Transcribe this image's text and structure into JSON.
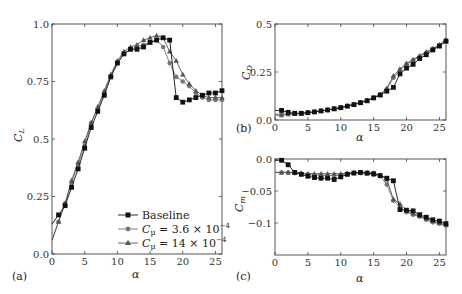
{
  "chart_data": [
    {
      "panel": "(a)",
      "type": "line",
      "xlabel": "α",
      "ylabel": "C_L",
      "xlim": [
        0,
        26
      ],
      "ylim": [
        0,
        1.0
      ],
      "xticks": [
        0,
        5,
        10,
        15,
        20,
        25
      ],
      "yticks": [
        0.0,
        0.25,
        0.5,
        0.75,
        1.0
      ],
      "ytick_labels": [
        "0.0",
        "0.25",
        "0.5",
        "0.75",
        "1.0"
      ],
      "legend_position": "lower right",
      "x": [
        1,
        2,
        3,
        4,
        5,
        6,
        7,
        8,
        9,
        10,
        11,
        12,
        13,
        14,
        15,
        16,
        17,
        18,
        19,
        20,
        21,
        22,
        23,
        24,
        25,
        26
      ],
      "series": [
        {
          "name": "Baseline",
          "marker": "square",
          "color": "#111111",
          "values": [
            0.17,
            0.21,
            0.29,
            0.37,
            0.46,
            0.55,
            0.62,
            0.69,
            0.77,
            0.83,
            0.87,
            0.89,
            0.89,
            0.9,
            0.92,
            0.93,
            0.94,
            0.93,
            0.68,
            0.66,
            0.67,
            0.68,
            0.69,
            0.7,
            0.7,
            0.71
          ]
        },
        {
          "name": "Cμ = 3.6 × 10⁻⁴",
          "marker": "circle",
          "color": "#777777",
          "values": [
            0.14,
            0.22,
            0.31,
            0.39,
            0.47,
            0.57,
            0.63,
            0.7,
            0.77,
            0.83,
            0.87,
            0.89,
            0.9,
            0.91,
            0.92,
            0.93,
            0.9,
            0.83,
            0.77,
            0.75,
            0.73,
            0.7,
            0.68,
            0.67,
            0.67,
            0.67
          ]
        },
        {
          "name": "Cμ = 14 × 10⁻⁴",
          "marker": "triangle",
          "color": "#555555",
          "values": [
            0.14,
            0.22,
            0.32,
            0.4,
            0.49,
            0.57,
            0.64,
            0.71,
            0.78,
            0.84,
            0.88,
            0.9,
            0.91,
            0.93,
            0.94,
            0.95,
            0.94,
            0.88,
            0.84,
            0.78,
            0.74,
            0.71,
            0.69,
            0.68,
            0.68,
            0.68
          ]
        }
      ]
    },
    {
      "panel": "(b)",
      "type": "line",
      "xlabel": "α",
      "ylabel": "C_D",
      "xlim": [
        0,
        26
      ],
      "ylim": [
        0,
        0.5
      ],
      "xticks": [
        0,
        5,
        10,
        15,
        20,
        25
      ],
      "yticks": [
        0.0,
        0.25,
        0.5
      ],
      "ytick_labels": [
        "0.0",
        "0.25",
        "0.5"
      ],
      "x": [
        1,
        2,
        3,
        4,
        5,
        6,
        7,
        8,
        9,
        10,
        11,
        12,
        13,
        14,
        15,
        16,
        17,
        18,
        19,
        20,
        21,
        22,
        23,
        24,
        25,
        26
      ],
      "series": [
        {
          "name": "Baseline",
          "marker": "square",
          "color": "#111111",
          "values": [
            0.05,
            0.04,
            0.035,
            0.035,
            0.038,
            0.042,
            0.047,
            0.052,
            0.058,
            0.064,
            0.072,
            0.08,
            0.09,
            0.1,
            0.115,
            0.13,
            0.15,
            0.17,
            0.24,
            0.27,
            0.29,
            0.32,
            0.34,
            0.365,
            0.385,
            0.41
          ]
        },
        {
          "name": "Cμ = 3.6 × 10⁻⁴",
          "marker": "circle",
          "color": "#777777",
          "values": [
            0.03,
            0.032,
            0.033,
            0.035,
            0.039,
            0.043,
            0.048,
            0.053,
            0.059,
            0.066,
            0.074,
            0.082,
            0.092,
            0.103,
            0.117,
            0.133,
            0.16,
            0.22,
            0.26,
            0.29,
            0.31,
            0.33,
            0.35,
            0.37,
            0.39,
            0.415
          ]
        },
        {
          "name": "Cμ = 14 × 10⁻⁴",
          "marker": "triangle",
          "color": "#555555",
          "values": [
            0.025,
            0.03,
            0.032,
            0.034,
            0.038,
            0.042,
            0.047,
            0.052,
            0.058,
            0.065,
            0.073,
            0.081,
            0.091,
            0.102,
            0.116,
            0.132,
            0.165,
            0.23,
            0.265,
            0.295,
            0.315,
            0.335,
            0.355,
            0.372,
            0.392,
            0.418
          ]
        }
      ]
    },
    {
      "panel": "(c)",
      "type": "line",
      "xlabel": "α",
      "ylabel": "C_m",
      "xlim": [
        0,
        26
      ],
      "ylim": [
        -0.15,
        0.0
      ],
      "xticks": [
        0,
        5,
        10,
        15,
        20,
        25
      ],
      "yticks": [
        0.0,
        -0.05,
        -0.1
      ],
      "ytick_labels": [
        "0.0",
        "−0.05",
        "−0.1"
      ],
      "x": [
        1,
        2,
        3,
        4,
        5,
        6,
        7,
        8,
        9,
        10,
        11,
        12,
        13,
        14,
        15,
        16,
        17,
        18,
        19,
        20,
        21,
        22,
        23,
        24,
        25,
        26
      ],
      "series": [
        {
          "name": "Baseline",
          "marker": "square",
          "color": "#111111",
          "values": [
            -0.002,
            -0.009,
            -0.021,
            -0.024,
            -0.027,
            -0.029,
            -0.03,
            -0.03,
            -0.032,
            -0.028,
            -0.024,
            -0.022,
            -0.021,
            -0.022,
            -0.023,
            -0.026,
            -0.03,
            -0.034,
            -0.079,
            -0.08,
            -0.081,
            -0.087,
            -0.091,
            -0.095,
            -0.097,
            -0.101
          ]
        },
        {
          "name": "Cμ = 3.6 × 10⁻⁴",
          "marker": "circle",
          "color": "#777777",
          "values": [
            -0.021,
            -0.021,
            -0.022,
            -0.023,
            -0.024,
            -0.025,
            -0.025,
            -0.026,
            -0.026,
            -0.025,
            -0.023,
            -0.022,
            -0.022,
            -0.023,
            -0.025,
            -0.027,
            -0.04,
            -0.065,
            -0.075,
            -0.083,
            -0.087,
            -0.09,
            -0.095,
            -0.099,
            -0.101,
            -0.104
          ]
        },
        {
          "name": "Cμ = 14 × 10⁻⁴",
          "marker": "triangle",
          "color": "#555555",
          "values": [
            -0.021,
            -0.021,
            -0.021,
            -0.022,
            -0.023,
            -0.023,
            -0.023,
            -0.023,
            -0.023,
            -0.023,
            -0.022,
            -0.021,
            -0.021,
            -0.021,
            -0.022,
            -0.025,
            -0.032,
            -0.063,
            -0.07,
            -0.08,
            -0.085,
            -0.089,
            -0.093,
            -0.097,
            -0.1,
            -0.103
          ]
        }
      ]
    }
  ],
  "legend": {
    "baseline": "Baseline",
    "s1_prefix": "C",
    "s1_sub": "μ",
    "s1_eq": " = 3.6 × 10",
    "s1_exp": "−4",
    "s2_prefix": "C",
    "s2_sub": "μ",
    "s2_eq": " = 14 × 10",
    "s2_exp": "−4"
  },
  "panel_labels": {
    "a": "(a)",
    "b": "(b)",
    "c": "(c)"
  },
  "axis_labels": {
    "alpha": "α",
    "CL_main": "C",
    "CL_sub": "L",
    "CD_main": "C",
    "CD_sub": "D",
    "Cm_main": "C",
    "Cm_sub": "m"
  }
}
